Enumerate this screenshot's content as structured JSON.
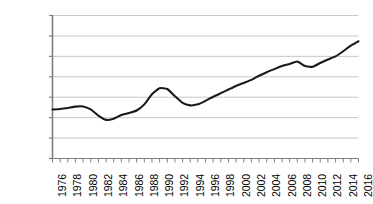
{
  "chart_data": {
    "type": "line",
    "title": "",
    "subtitle": "",
    "xlabel": "",
    "ylabel": "",
    "xlim": [
      1976,
      2016
    ],
    "ylim": [
      20000,
      34000
    ],
    "grid": true,
    "legend": false,
    "y_ticks": [
      "34,000",
      "32,000",
      "30,000",
      "28,000",
      "26,000",
      "24,000",
      "22,000",
      "20,000"
    ],
    "y_tick_values": [
      34000,
      32000,
      30000,
      28000,
      26000,
      24000,
      22000,
      20000
    ],
    "x_tick_labels": [
      "1976",
      "1978",
      "1980",
      "1982",
      "1984",
      "1986",
      "1988",
      "1990",
      "1992",
      "1994",
      "1996",
      "1998",
      "2000",
      "2002",
      "2004",
      "2006",
      "2008",
      "2010",
      "2012",
      "2014",
      "2016"
    ],
    "x_tick_values": [
      1976,
      1978,
      1980,
      1982,
      1984,
      1986,
      1988,
      1990,
      1992,
      1994,
      1996,
      1998,
      2000,
      2002,
      2004,
      2006,
      2008,
      2010,
      2012,
      2014,
      2016
    ],
    "x_minor_ticks": [
      1976,
      1977,
      1978,
      1979,
      1980,
      1981,
      1982,
      1983,
      1984,
      1985,
      1986,
      1987,
      1988,
      1989,
      1990,
      1991,
      1992,
      1993,
      1994,
      1995,
      1996,
      1997,
      1998,
      1999,
      2000,
      2001,
      2002,
      2003,
      2004,
      2005,
      2006,
      2007,
      2008,
      2009,
      2010,
      2011,
      2012,
      2013,
      2014,
      2015,
      2016
    ],
    "series": [
      {
        "name": "series-1",
        "color": "#1a1a1a",
        "x": [
          1976,
          1977,
          1978,
          1979,
          1980,
          1981,
          1982,
          1983,
          1984,
          1985,
          1986,
          1987,
          1988,
          1989,
          1990,
          1991,
          1992,
          1993,
          1994,
          1995,
          1996,
          1997,
          1998,
          1999,
          2000,
          2001,
          2002,
          2003,
          2004,
          2005,
          2006,
          2007,
          2008,
          2009,
          2010,
          2011,
          2012,
          2013,
          2014,
          2015,
          2016
        ],
        "values": [
          24800,
          24850,
          24950,
          25080,
          25100,
          24800,
          24200,
          23780,
          23900,
          24250,
          24450,
          24700,
          25300,
          26300,
          26880,
          26800,
          26100,
          25450,
          25200,
          25300,
          25650,
          26050,
          26400,
          26750,
          27100,
          27400,
          27700,
          28100,
          28450,
          28750,
          29050,
          29250,
          29500,
          29050,
          28980,
          29350,
          29700,
          30000,
          30500,
          31050,
          31480
        ]
      }
    ]
  },
  "axis_style": {
    "gridline_color": "#c8c8c8",
    "axis_color": "#7f7f7f",
    "line_color": "#1a1a1a",
    "background": "#ffffff"
  }
}
